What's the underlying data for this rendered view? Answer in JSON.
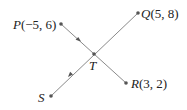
{
  "diagram": {
    "type": "geometry-line-segments",
    "points": [
      {
        "id": "P",
        "name": "P",
        "coords": "(−5, 6)",
        "x": -5,
        "y": 6
      },
      {
        "id": "Q",
        "name": "Q",
        "coords": "(5, 8)",
        "x": 5,
        "y": 8
      },
      {
        "id": "R",
        "name": "R",
        "coords": "(3, 2)",
        "x": 3,
        "y": 2
      },
      {
        "id": "S",
        "name": "S",
        "coords": ""
      },
      {
        "id": "T",
        "name": "T",
        "coords": ""
      }
    ],
    "segments": [
      {
        "from": "P",
        "to": "R",
        "through": "T",
        "arrow": "P-to-T"
      },
      {
        "from": "Q",
        "to": "S",
        "through": "T",
        "arrow": "T-to-S"
      }
    ],
    "colors": {
      "line": "#8a8a8a",
      "point": "#555555",
      "text": "#222222"
    }
  },
  "labels": {
    "P": "P",
    "P_coords": "(−5, 6)",
    "Q": "Q",
    "Q_coords": "(5, 8)",
    "R": "R",
    "R_coords": "(3, 2)",
    "S": "S",
    "T": "T"
  }
}
